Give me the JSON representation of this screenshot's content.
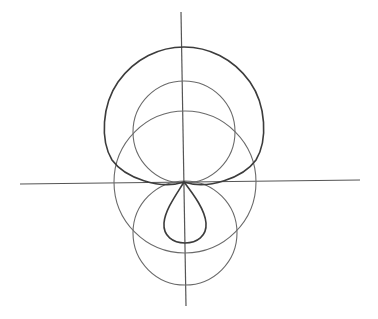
{
  "figure": {
    "type": "geometric construction of a limaçon with inner loop",
    "colors": {
      "background": "#ffffff",
      "axes": "#555555",
      "circles": "#6a6a6a",
      "curve": "#3c3c3c"
    },
    "origin": {
      "x": 184,
      "y": 182
    },
    "axes": {
      "horizontal": {
        "x1": 20,
        "y1": 184,
        "x2": 360,
        "y2": 180
      },
      "vertical": {
        "x1": 181,
        "y1": 12,
        "x2": 186,
        "y2": 306
      }
    },
    "circles": [
      {
        "name": "upper-circle",
        "cx": 184,
        "cy": 132,
        "r": 51
      },
      {
        "name": "middle-circle",
        "cx": 185,
        "cy": 182,
        "r": 71
      },
      {
        "name": "lower-circle",
        "cx": 185,
        "cy": 233,
        "r": 52
      }
    ],
    "curve": {
      "name": "limacon",
      "outer_loop_top_y": 47,
      "outer_loop_left_x": 104,
      "outer_loop_right_x": 264,
      "inner_loop_bottom_y": 243,
      "inner_loop_left_x": 164,
      "inner_loop_right_x": 207
    },
    "caption": ""
  }
}
